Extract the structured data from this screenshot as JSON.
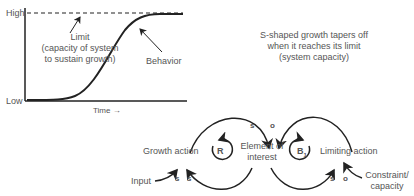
{
  "graph": {
    "y_high": "High",
    "y_low": "Low",
    "x_label": "Time →",
    "limit_label": [
      "Limit",
      "(capacity of system",
      "to sustain growth)"
    ],
    "behavior_label": "Behavior"
  },
  "caption": [
    "S-shaped growth tapers off",
    "when it reaches its limit",
    "(system capacity)"
  ],
  "loop_diagram": {
    "growth_action": "Growth action",
    "element": [
      "Element of",
      "interest"
    ],
    "limiting_action": "Limiting action",
    "input": "Input",
    "constraint": [
      "Constraint/",
      "capacity"
    ],
    "reinforcing_loop": "R",
    "balancing_loop": "B",
    "balancing_sub": "1",
    "polarities": {
      "growth_to_element": "s",
      "limiting_to_element": "o",
      "input_to_growth": "s",
      "element_to_growth": "s",
      "element_to_limiting": "s",
      "constraint_to_limiting": "o"
    }
  },
  "colors": {
    "line": "#222222",
    "text": "#555555"
  }
}
